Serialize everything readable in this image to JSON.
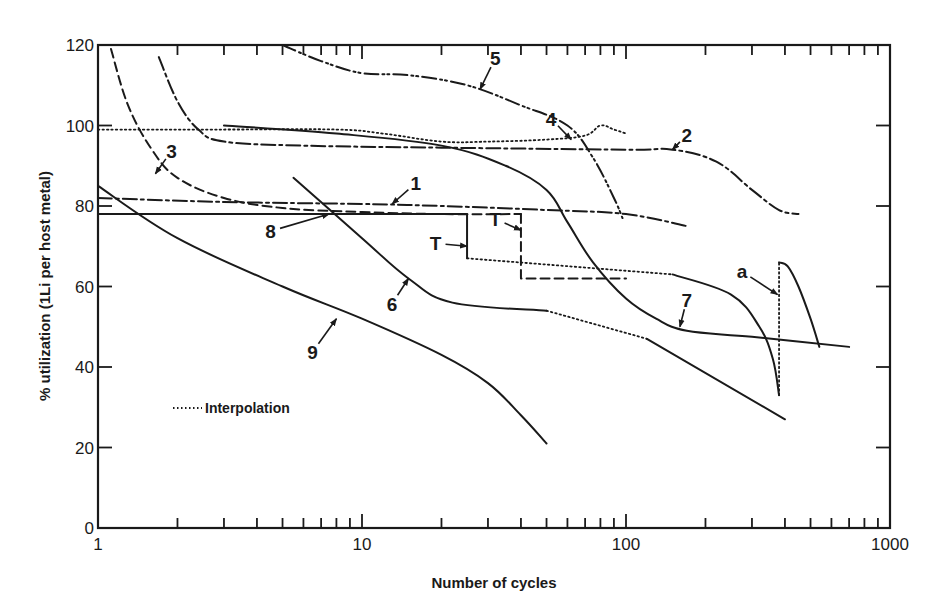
{
  "chart_data": {
    "type": "line",
    "title": "",
    "xlabel": "Number of cycles",
    "ylabel": "% utilization (1Li per host metal)",
    "xscale": "log",
    "xlim": [
      1,
      1000
    ],
    "ylim": [
      0,
      120
    ],
    "xticks": [
      1,
      10,
      100,
      1000
    ],
    "xtick_labels": [
      "1",
      "10",
      "100",
      "1000"
    ],
    "yticks": [
      0,
      20,
      40,
      60,
      80,
      100,
      120
    ],
    "ytick_labels": [
      "0",
      "20",
      "40",
      "60",
      "80",
      "100",
      "120"
    ],
    "grid": false,
    "legend": {
      "placement": "lower-left",
      "entries": [
        {
          "label": "Interpolation",
          "style": "dotted"
        }
      ]
    },
    "series": [
      {
        "name": "1",
        "style": "dashdot",
        "segments": [
          {
            "style": "dashdot",
            "points": [
              [
                1,
                82
              ],
              [
                3,
                81
              ],
              [
                10,
                80.5
              ],
              [
                20,
                80
              ],
              [
                50,
                79
              ],
              [
                100,
                78
              ],
              [
                170,
                75
              ]
            ]
          }
        ]
      },
      {
        "name": "2",
        "style": "dashdot",
        "segments": [
          {
            "style": "dashdot",
            "points": [
              [
                1.7,
                117
              ],
              [
                2,
                106
              ],
              [
                2.4,
                99
              ],
              [
                3,
                96
              ],
              [
                6,
                95
              ],
              [
                20,
                94.5
              ],
              [
                100,
                94
              ],
              [
                150,
                94
              ],
              [
                220,
                91
              ],
              [
                300,
                84
              ],
              [
                380,
                79
              ],
              [
                450,
                78
              ]
            ]
          }
        ]
      },
      {
        "name": "3",
        "style": "dashed",
        "segments": [
          {
            "style": "dashed",
            "points": [
              [
                1.12,
                119
              ],
              [
                1.3,
                105
              ],
              [
                1.6,
                94
              ],
              [
                2,
                87
              ],
              [
                3,
                82
              ],
              [
                5,
                79.5
              ],
              [
                10,
                78.5
              ],
              [
                20,
                78
              ],
              [
                40,
                78
              ]
            ]
          },
          {
            "style": "dashed",
            "points": [
              [
                40,
                78
              ],
              [
                40,
                62
              ],
              [
                100,
                62
              ]
            ]
          }
        ]
      },
      {
        "name": "4",
        "style": "dotted",
        "segments": [
          {
            "style": "dotted",
            "points": [
              [
                1,
                99
              ],
              [
                3,
                99
              ],
              [
                8,
                99
              ],
              [
                12,
                98
              ],
              [
                20,
                96
              ],
              [
                30,
                96
              ],
              [
                50,
                96.5
              ],
              [
                70,
                97.5
              ],
              [
                80,
                100
              ],
              [
                90,
                99
              ],
              [
                100,
                98
              ]
            ]
          }
        ]
      },
      {
        "name": "5",
        "style": "dashdotdot",
        "segments": [
          {
            "style": "dashdotdot",
            "points": [
              [
                5,
                120
              ],
              [
                7,
                116
              ],
              [
                10,
                113
              ],
              [
                15,
                112.5
              ],
              [
                25,
                110
              ],
              [
                40,
                105
              ],
              [
                60,
                100
              ],
              [
                75,
                92
              ],
              [
                90,
                82
              ],
              [
                97,
                77
              ]
            ]
          }
        ]
      },
      {
        "name": "6",
        "style": "solid",
        "segments": [
          {
            "style": "solid",
            "points": [
              [
                5.5,
                87
              ],
              [
                10,
                72
              ],
              [
                15,
                62
              ],
              [
                22,
                56
              ],
              [
                50,
                54
              ]
            ]
          },
          {
            "style": "dotted",
            "points": [
              [
                50,
                54
              ],
              [
                120,
                47
              ]
            ]
          },
          {
            "style": "solid",
            "points": [
              [
                120,
                47
              ],
              [
                400,
                27
              ]
            ]
          }
        ]
      },
      {
        "name": "7",
        "style": "solid",
        "segments": [
          {
            "style": "solid",
            "points": [
              [
                3,
                100
              ],
              [
                8,
                98
              ],
              [
                20,
                95
              ],
              [
                35,
                90
              ],
              [
                50,
                84
              ],
              [
                60,
                76
              ],
              [
                75,
                66
              ],
              [
                100,
                57
              ],
              [
                130,
                52
              ],
              [
                170,
                49
              ],
              [
                300,
                47.5
              ],
              [
                700,
                45
              ]
            ]
          }
        ]
      },
      {
        "name": "8",
        "style": "solid",
        "segments": [
          {
            "style": "solid",
            "points": [
              [
                1,
                78
              ],
              [
                25,
                78
              ],
              [
                25,
                67
              ]
            ]
          },
          {
            "style": "dotted",
            "points": [
              [
                25,
                67
              ],
              [
                150,
                63
              ]
            ]
          },
          {
            "style": "solid",
            "points": [
              [
                150,
                63
              ],
              [
                250,
                58
              ],
              [
                320,
                50
              ],
              [
                360,
                42
              ],
              [
                380,
                33
              ]
            ]
          }
        ]
      },
      {
        "name": "9",
        "style": "solid",
        "segments": [
          {
            "style": "solid",
            "points": [
              [
                1,
                85
              ],
              [
                2,
                72
              ],
              [
                5,
                60
              ],
              [
                10,
                52
              ],
              [
                20,
                43
              ],
              [
                30,
                36
              ],
              [
                40,
                28
              ],
              [
                50,
                21
              ]
            ]
          }
        ]
      },
      {
        "name": "a",
        "style": "solid",
        "segments": [
          {
            "style": "dotted",
            "points": [
              [
                380,
                33
              ],
              [
                380,
                66
              ]
            ]
          },
          {
            "style": "solid",
            "points": [
              [
                380,
                66
              ],
              [
                410,
                65
              ],
              [
                450,
                60
              ],
              [
                500,
                52
              ],
              [
                540,
                45
              ]
            ]
          }
        ]
      }
    ],
    "annotations": [
      {
        "text": "1",
        "x": 16,
        "y": 84,
        "points_to": [
          13,
          80.5
        ]
      },
      {
        "text": "2",
        "x": 170,
        "y": 96,
        "points_to": [
          150,
          94
        ]
      },
      {
        "text": "3",
        "x": 1.9,
        "y": 92,
        "points_to": [
          1.65,
          88
        ]
      },
      {
        "text": "4",
        "x": 52,
        "y": 100,
        "points_to": [
          62,
          96.5
        ]
      },
      {
        "text": "5",
        "x": 32,
        "y": 115,
        "points_to": [
          28,
          109
        ]
      },
      {
        "text": "6",
        "x": 13,
        "y": 54,
        "points_to": [
          15,
          62
        ]
      },
      {
        "text": "7",
        "x": 170,
        "y": 55,
        "points_to": [
          160,
          50
        ]
      },
      {
        "text": "8",
        "x": 4.5,
        "y": 72,
        "points_to": [
          7.5,
          78
        ]
      },
      {
        "text": "9",
        "x": 6.5,
        "y": 42,
        "points_to": [
          8,
          52
        ]
      },
      {
        "text": "T",
        "x": 19,
        "y": 69,
        "points_to": [
          25,
          70
        ]
      },
      {
        "text": "T",
        "x": 32,
        "y": 75,
        "points_to": [
          40,
          74
        ]
      },
      {
        "text": "a",
        "x": 275,
        "y": 62,
        "points_to": [
          375,
          58
        ]
      }
    ]
  }
}
